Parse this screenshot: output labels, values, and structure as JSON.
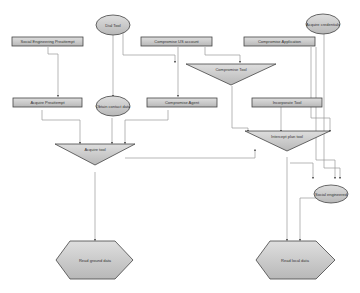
{
  "diagram": {
    "title": "",
    "nodes": {
      "social_eng": {
        "label": "Social Engineering Preattempt",
        "shape": "rectangle"
      },
      "dial_tool": {
        "label": "Dial Tool",
        "shape": "ellipse"
      },
      "compromise_us": {
        "label": "Compromise US account",
        "shape": "rectangle"
      },
      "compromise_application": {
        "label": "Compromise Application",
        "shape": "rectangle"
      },
      "acquire_credentials": {
        "label": "Acquire credentials",
        "shape": "ellipse"
      },
      "compromise_tool": {
        "label": "Compromise Tool",
        "shape": "triangle"
      },
      "acquire_preattempt": {
        "label": "Acquire Preattempt",
        "shape": "rectangle"
      },
      "obtain_contact": {
        "label": "Obtain contact data",
        "shape": "ellipse"
      },
      "compromise_agent": {
        "label": "Compromise Agent",
        "shape": "rectangle"
      },
      "incorporate_tool": {
        "label": "Incorporate Tool",
        "shape": "rectangle"
      },
      "acquire_tool": {
        "label": "Acquire tool",
        "shape": "triangle"
      },
      "intercept_plan": {
        "label": "Intercept plan tool",
        "shape": "triangle"
      },
      "social_engineered": {
        "label": "Social engineered",
        "shape": "ellipse"
      },
      "read_ground": {
        "label": "Read ground data",
        "shape": "hexagon"
      },
      "read_local": {
        "label": "Read local data",
        "shape": "hexagon"
      }
    },
    "colors": {
      "node_fill": "#c8c8c8",
      "node_border": "#444444",
      "edge": "#888888",
      "background": "#ffffff"
    }
  }
}
